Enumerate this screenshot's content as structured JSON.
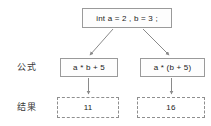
{
  "diagram": {
    "title_box": {
      "text": "int a = 2 , b = 3 ;",
      "style": "solid"
    },
    "rows": [
      {
        "label": "公式",
        "nodes": [
          {
            "text": "a * b + 5",
            "style": "solid"
          },
          {
            "text": "a * (b + 5)",
            "style": "solid"
          }
        ]
      },
      {
        "label": "结果",
        "nodes": [
          {
            "text": "11",
            "style": "dashed"
          },
          {
            "text": "16",
            "style": "dashed"
          }
        ]
      }
    ],
    "colors": {
      "border": "#9a9a9a",
      "dashed_border": "#8f8f8f",
      "arrow": "#8a8a8a",
      "text": "#1a1a1a",
      "label_text": "#3a3a3a",
      "background": "#ffffff",
      "node_fill": "#fdfdfd"
    },
    "arrows": [
      {
        "from": "title_box",
        "to": "formula-left",
        "kind": "diagonal"
      },
      {
        "from": "title_box",
        "to": "formula-right",
        "kind": "diagonal"
      },
      {
        "from": "formula-left",
        "to": "result-left",
        "kind": "vertical"
      },
      {
        "from": "formula-right",
        "to": "result-right",
        "kind": "vertical"
      }
    ]
  }
}
